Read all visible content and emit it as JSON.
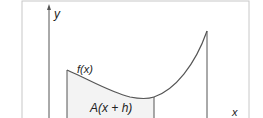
{
  "diagram": {
    "labels": {
      "y_axis": "y",
      "x_axis": "x",
      "function": "f(x)",
      "area": "A(x + h)"
    },
    "colors": {
      "background": "#ffffff",
      "frame": "#c8c8c8",
      "axes": "#555555",
      "curve": "#555555",
      "area_fill": "#f3f3f3",
      "text": "#222222"
    }
  }
}
